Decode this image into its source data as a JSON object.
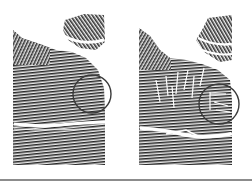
{
  "figure": {
    "panels": [
      {
        "id": "left",
        "label": "fingerprint-original",
        "highlight": {
          "cx": 92,
          "cy": 94,
          "r": 19
        },
        "crease_y": 125,
        "has_scratch_marks": false
      },
      {
        "id": "right",
        "label": "fingerprint-altered",
        "highlight": {
          "cx": 93,
          "cy": 104,
          "r": 20
        },
        "crease_y": 132,
        "has_scratch_marks": true
      }
    ],
    "colors": {
      "ridge": "#2b2b2b",
      "ridge_light": "#6a6a6a",
      "background": "#ffffff",
      "circle_stroke": "#3a3a3a",
      "bottom_rule": "#8c8c8c"
    }
  }
}
